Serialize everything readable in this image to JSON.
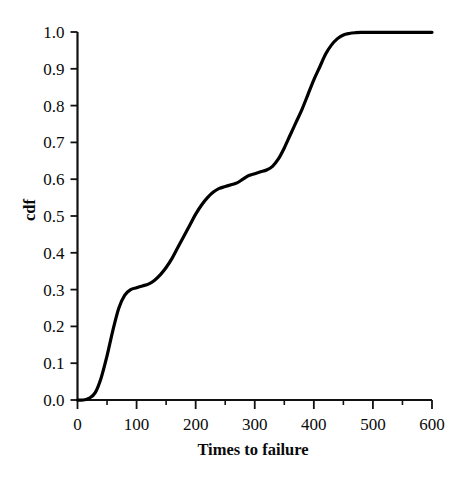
{
  "chart_data": {
    "type": "line",
    "title": "",
    "subtitle": "",
    "xlabel": "Times to failure",
    "ylabel": "cdf",
    "xlim": [
      0,
      600
    ],
    "ylim": [
      0.0,
      1.0
    ],
    "grid": false,
    "legend": null,
    "legend_position": "none",
    "line_color": "#000000",
    "line_width": 3.2,
    "x_ticks_major": [
      0,
      100,
      200,
      300,
      400,
      500,
      600
    ],
    "x_tick_labels": [
      "0",
      "100",
      "200",
      "300",
      "400",
      "500",
      "600"
    ],
    "x_ticks_minor": [
      50,
      150,
      250,
      350,
      450,
      550
    ],
    "y_ticks_major": [
      0.0,
      0.1,
      0.2,
      0.3,
      0.4,
      0.5,
      0.6,
      0.7,
      0.8,
      0.9,
      1.0
    ],
    "y_tick_labels": [
      "0.0",
      "0.1",
      "0.2",
      "0.3",
      "0.4",
      "0.5",
      "0.6",
      "0.7",
      "0.8",
      "0.9",
      "1.0"
    ],
    "series": [
      {
        "name": "cdf",
        "x": [
          0,
          10,
          20,
          30,
          40,
          50,
          60,
          70,
          80,
          90,
          100,
          110,
          120,
          130,
          140,
          150,
          160,
          170,
          180,
          190,
          200,
          210,
          220,
          230,
          240,
          250,
          260,
          270,
          280,
          290,
          300,
          310,
          320,
          330,
          340,
          350,
          360,
          370,
          380,
          390,
          400,
          410,
          420,
          430,
          440,
          450,
          460,
          470,
          480,
          500,
          520,
          540,
          560,
          580,
          600
        ],
        "y": [
          0.0,
          0.0,
          0.005,
          0.02,
          0.06,
          0.12,
          0.19,
          0.25,
          0.285,
          0.3,
          0.305,
          0.31,
          0.315,
          0.325,
          0.34,
          0.36,
          0.385,
          0.415,
          0.445,
          0.475,
          0.505,
          0.53,
          0.55,
          0.565,
          0.575,
          0.58,
          0.585,
          0.59,
          0.6,
          0.61,
          0.615,
          0.62,
          0.625,
          0.635,
          0.655,
          0.685,
          0.72,
          0.755,
          0.79,
          0.83,
          0.87,
          0.905,
          0.94,
          0.965,
          0.982,
          0.992,
          0.996,
          0.998,
          0.999,
          0.999,
          0.999,
          0.999,
          0.999,
          0.999,
          0.999
        ]
      }
    ],
    "annotations": []
  },
  "axes": {
    "y_label_text": "cdf",
    "x_label_text": "Times to failure"
  }
}
